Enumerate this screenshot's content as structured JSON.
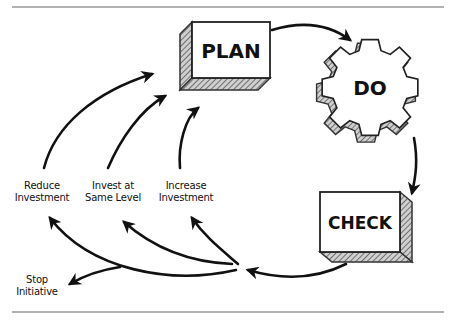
{
  "diagram": {
    "type": "PDCA cycle with decision outcomes",
    "nodes": {
      "plan": {
        "label": "PLAN",
        "shape": "3d-box"
      },
      "do": {
        "label": "DO",
        "shape": "gear"
      },
      "check": {
        "label": "CHECK",
        "shape": "3d-box"
      }
    },
    "outcomes": [
      {
        "label_line1": "Reduce",
        "label_line2": "Investment"
      },
      {
        "label_line1": "Invest at",
        "label_line2": "Same Level"
      },
      {
        "label_line1": "Increase",
        "label_line2": "Investment"
      },
      {
        "label_line1": "Stop",
        "label_line2": "Initiative"
      }
    ],
    "edges": [
      {
        "from": "PLAN",
        "to": "DO"
      },
      {
        "from": "DO",
        "to": "CHECK"
      },
      {
        "from": "CHECK",
        "to": "decision-point"
      },
      {
        "from": "decision-point",
        "to": "Reduce Investment"
      },
      {
        "from": "decision-point",
        "to": "Invest at Same Level"
      },
      {
        "from": "decision-point",
        "to": "Increase Investment"
      },
      {
        "from": "decision-point",
        "to": "Stop Initiative"
      },
      {
        "from": "Reduce Investment",
        "to": "PLAN"
      },
      {
        "from": "Invest at Same Level",
        "to": "PLAN"
      },
      {
        "from": "Increase Investment",
        "to": "PLAN"
      }
    ],
    "colors": {
      "ink": "#111111",
      "shade": "#777777",
      "rule": "#666666",
      "background": "#ffffff"
    }
  }
}
